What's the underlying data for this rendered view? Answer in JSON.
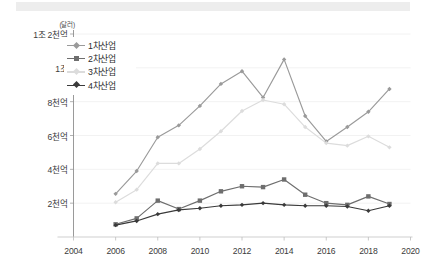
{
  "banner": {
    "label": ""
  },
  "axis": {
    "unit_label": "(달러)",
    "y_tick_labels": [
      "1조 2천억",
      "1조",
      "8천억",
      "6천억",
      "4천억",
      "2천억"
    ],
    "y_tick_values": [
      1200,
      1000,
      800,
      600,
      400,
      200
    ],
    "x_tick_labels": [
      "2004",
      "2006",
      "2008",
      "2010",
      "2012",
      "2014",
      "2016",
      "2018",
      "2020"
    ],
    "x_tick_values": [
      2004,
      2006,
      2008,
      2010,
      2012,
      2014,
      2016,
      2018,
      2020
    ]
  },
  "legend": {
    "items": [
      {
        "label": "1차산업",
        "color": "#9a9a9a",
        "marker": "diamond"
      },
      {
        "label": "2차산업",
        "color": "#6e6e6e",
        "marker": "square"
      },
      {
        "label": "3차산업",
        "color": "#dcdcdc",
        "marker": "diamond"
      },
      {
        "label": "4차산업",
        "color": "#3a3a3a",
        "marker": "diamond"
      }
    ]
  },
  "chart_data": {
    "type": "line",
    "title": "",
    "subtitle": "",
    "xlabel": "",
    "ylabel": "(달러)",
    "xlim": [
      2004,
      2020
    ],
    "ylim": [
      0,
      1200
    ],
    "grid": true,
    "grid_axis": "y",
    "legend_position": "top-left-inside",
    "unit_note": "값 단위: 억 달러 (100 million USD)",
    "x": [
      2006,
      2007,
      2008,
      2009,
      2010,
      2011,
      2012,
      2013,
      2014,
      2015,
      2016,
      2017,
      2018,
      2019
    ],
    "categories": [
      "2006",
      "2007",
      "2008",
      "2009",
      "2010",
      "2011",
      "2012",
      "2013",
      "2014",
      "2015",
      "2016",
      "2017",
      "2018",
      "2019"
    ],
    "series": [
      {
        "name": "1차산업",
        "color": "#9a9a9a",
        "marker": "diamond",
        "values": [
          255,
          390,
          590,
          660,
          775,
          905,
          980,
          825,
          1050,
          715,
          565,
          650,
          740,
          875
        ]
      },
      {
        "name": "2차산업",
        "color": "#6e6e6e",
        "marker": "square",
        "values": [
          75,
          110,
          215,
          165,
          215,
          270,
          300,
          295,
          340,
          250,
          200,
          190,
          240,
          195
        ]
      },
      {
        "name": "3차산업",
        "color": "#dcdcdc",
        "marker": "diamond",
        "values": [
          205,
          280,
          435,
          435,
          520,
          625,
          745,
          810,
          785,
          650,
          555,
          540,
          595,
          530
        ]
      },
      {
        "name": "4차산업",
        "color": "#3a3a3a",
        "marker": "diamond",
        "values": [
          70,
          95,
          135,
          160,
          170,
          185,
          190,
          200,
          190,
          185,
          185,
          180,
          155,
          185
        ]
      }
    ]
  }
}
